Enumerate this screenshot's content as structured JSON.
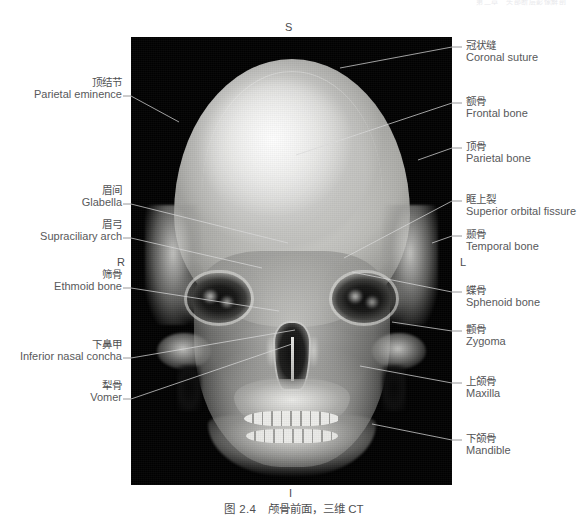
{
  "running_head": "第二章　头部断层影像解剖",
  "figure": {
    "caption_number": "图 2.4",
    "caption_text": "颅骨前面，三维 CT",
    "modality": "三维 CT",
    "view": "颅骨前面"
  },
  "orientation_markers": {
    "superior": "S",
    "inferior": "I",
    "right": "R",
    "left": "L"
  },
  "labels_left": [
    {
      "cn": "顶结节",
      "en": "Parietal eminence"
    },
    {
      "cn": "眉间",
      "en": "Glabella"
    },
    {
      "cn": "眉弓",
      "en": "Supraciliary arch"
    },
    {
      "cn": "筛骨",
      "en": "Ethmoid bone"
    },
    {
      "cn": "下鼻甲",
      "en": "Inferior nasal concha"
    },
    {
      "cn": "犁骨",
      "en": "Vomer"
    }
  ],
  "labels_right": [
    {
      "cn": "冠状缝",
      "en": "Coronal suture"
    },
    {
      "cn": "额骨",
      "en": "Frontal bone"
    },
    {
      "cn": "顶骨",
      "en": "Parietal bone"
    },
    {
      "cn": "眶上裂",
      "en": "Superior orbital fissure"
    },
    {
      "cn": "颞骨",
      "en": "Temporal bone"
    },
    {
      "cn": "蝶骨",
      "en": "Sphenoid bone"
    },
    {
      "cn": "颧骨",
      "en": "Zygoma"
    },
    {
      "cn": "上颌骨",
      "en": "Maxilla"
    },
    {
      "cn": "下颌骨",
      "en": "Mandible"
    }
  ],
  "colors": {
    "panel_background": "#010101",
    "page_background": "#ffffff",
    "text": "#58595b",
    "leader_line_outside": "#7d7e80",
    "leader_line_inside": "#ffffff"
  }
}
